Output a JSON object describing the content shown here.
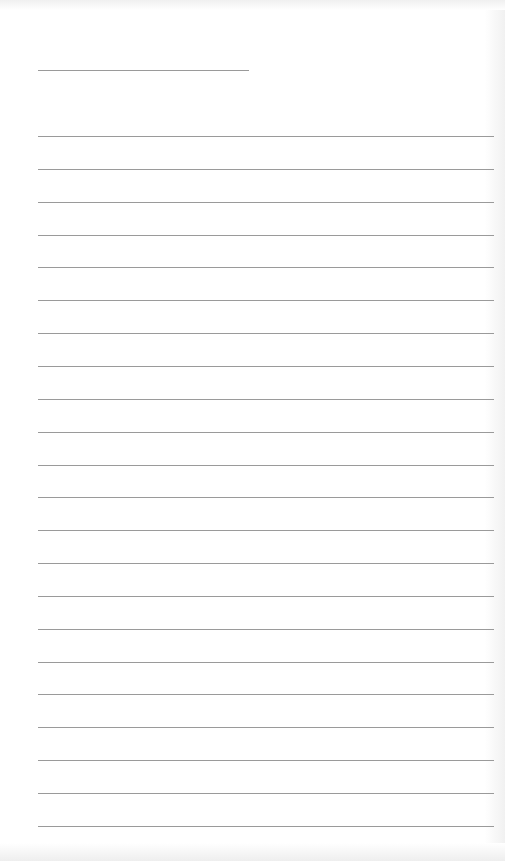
{
  "page": {
    "type": "ruled-paper",
    "background": "#ffffff",
    "rule_color": "#9a9a9a",
    "header_line": {
      "x": 38,
      "y": 70,
      "width": 211
    },
    "body_lines": {
      "count": 22,
      "x": 38,
      "width": 456,
      "first_y": 136,
      "spacing": 32.85
    }
  }
}
